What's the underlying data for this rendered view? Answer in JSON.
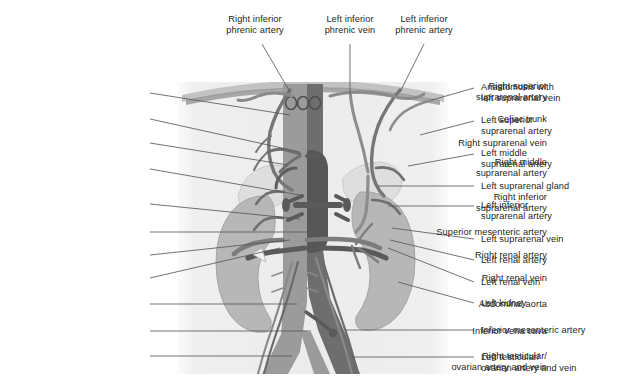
{
  "figure": {
    "panel": {
      "x": 178,
      "y": 82,
      "width": 270,
      "height": 292
    },
    "colors": {
      "background": "#ffffff",
      "panel_fill": "#f0f0f0",
      "panel_fill_inner": "#e9e9e9",
      "artery": "#9b9b9b",
      "vein": "#6e6e6e",
      "vein_dark": "#5a5a5a",
      "kidney": "#b4b4b4",
      "kidney_outline": "#9d9d9d",
      "suprarenal_gland": "#dcdcdc",
      "diaphragm": "#a8a8a8",
      "diaphragm_light": "#c9c9c9",
      "leader_line": "#5a5a5a",
      "text": "#231f20"
    }
  },
  "labels_top": [
    {
      "id": "right-inferior-phrenic-artery",
      "lines": [
        "Right inferior",
        "phrenic artery"
      ],
      "x": 200,
      "y": 14,
      "width": 110,
      "leader": [
        [
          262,
          44
        ],
        [
          290,
          92
        ]
      ]
    },
    {
      "id": "left-inferior-phrenic-vein",
      "lines": [
        "Left inferior",
        "phrenic vein"
      ],
      "x": 302,
      "y": 14,
      "width": 96,
      "leader": [
        [
          350,
          44
        ],
        [
          350,
          94
        ]
      ]
    },
    {
      "id": "left-inferior-phrenic-artery",
      "lines": [
        "Left inferior",
        "phrenic artery"
      ],
      "x": 372,
      "y": 14,
      "width": 104,
      "leader": [
        [
          424,
          44
        ],
        [
          400,
          92
        ]
      ]
    }
  ],
  "labels_left": [
    {
      "id": "right-superior-suprarenal-artery",
      "lines": [
        "Right superior",
        "suprarenal artery"
      ],
      "right": 547,
      "y": 81,
      "leader": [
        [
          150,
          93
        ],
        [
          290,
          115
        ]
      ]
    },
    {
      "id": "celiac-trunk",
      "lines": [
        "Celiac trunk"
      ],
      "right": 547,
      "y": 114,
      "leader": [
        [
          150,
          119
        ],
        [
          300,
          152
        ]
      ]
    },
    {
      "id": "right-suprarenal-vein",
      "lines": [
        "Right suprarenal vein"
      ],
      "right": 547,
      "y": 138,
      "leader": [
        [
          150,
          143
        ],
        [
          288,
          165
        ]
      ]
    },
    {
      "id": "right-middle-suprarenal-artery",
      "lines": [
        "Right middle",
        "suprarenal artery"
      ],
      "right": 547,
      "y": 157,
      "leader": [
        [
          150,
          169
        ],
        [
          300,
          195
        ]
      ]
    },
    {
      "id": "right-inferior-suprarenal-artery",
      "lines": [
        "Right inferior",
        "suprarenal artery"
      ],
      "right": 547,
      "y": 192,
      "leader": [
        [
          150,
          204
        ],
        [
          300,
          219
        ]
      ]
    },
    {
      "id": "superior-mesenteric-artery",
      "lines": [
        "Superior mesenteric artery"
      ],
      "right": 547,
      "y": 227,
      "leader": [
        [
          150,
          232
        ],
        [
          307,
          232
        ]
      ]
    },
    {
      "id": "right-renal-artery",
      "lines": [
        "Right renal artery"
      ],
      "right": 547,
      "y": 250,
      "leader": [
        [
          150,
          255
        ],
        [
          290,
          240
        ]
      ]
    },
    {
      "id": "right-renal-vein",
      "lines": [
        "Right renal vein"
      ],
      "right": 547,
      "y": 273,
      "leader": [
        [
          150,
          278
        ],
        [
          280,
          248
        ]
      ]
    },
    {
      "id": "abdominal-aorta",
      "lines": [
        "Abdominal aorta"
      ],
      "right": 547,
      "y": 299,
      "leader": [
        [
          150,
          304
        ],
        [
          297,
          304
        ]
      ]
    },
    {
      "id": "inferior-vena-cava",
      "lines": [
        "Inferior vena cava"
      ],
      "right": 547,
      "y": 326,
      "leader": [
        [
          150,
          331
        ],
        [
          311,
          331
        ]
      ]
    },
    {
      "id": "right-testicular-ovarian-artery-and-vein",
      "lines": [
        "Right testicular/",
        "ovarian artery and vein"
      ],
      "right": 547,
      "y": 351,
      "leader": [
        [
          150,
          356
        ],
        [
          292,
          356
        ]
      ]
    }
  ],
  "labels_right": [
    {
      "id": "anastomosis-with-left-suprarenal-vein",
      "lines": [
        "Anastomosis with",
        "left suprarenal vein"
      ],
      "left": 481,
      "y": 82,
      "leader": [
        [
          474,
          88
        ],
        [
          432,
          100
        ]
      ]
    },
    {
      "id": "left-superior-suprarenal-artery",
      "lines": [
        "Left superior",
        "suprarenal artery"
      ],
      "left": 481,
      "y": 115,
      "leader": [
        [
          474,
          121
        ],
        [
          420,
          135
        ]
      ]
    },
    {
      "id": "left-middle-suprarenal-artery",
      "lines": [
        "Left middle",
        "suprarenal artery"
      ],
      "left": 481,
      "y": 148,
      "leader": [
        [
          474,
          154
        ],
        [
          408,
          166
        ]
      ]
    },
    {
      "id": "left-suprarenal-gland",
      "lines": [
        "Left suprarenal gland"
      ],
      "left": 481,
      "y": 181,
      "leader": [
        [
          474,
          186
        ],
        [
          378,
          186
        ]
      ]
    },
    {
      "id": "left-inferior-suprarenal-artery",
      "lines": [
        "Left inferior",
        "suprarenal artery"
      ],
      "left": 481,
      "y": 200,
      "leader": [
        [
          474,
          206
        ],
        [
          388,
          206
        ]
      ]
    },
    {
      "id": "left-suprarenal-vein",
      "lines": [
        "Left suprarenal vein"
      ],
      "left": 481,
      "y": 234,
      "leader": [
        [
          474,
          239
        ],
        [
          392,
          228
        ]
      ]
    },
    {
      "id": "left-renal-artery",
      "lines": [
        "Left renal artery"
      ],
      "left": 481,
      "y": 255,
      "leader": [
        [
          474,
          260
        ],
        [
          390,
          240
        ]
      ]
    },
    {
      "id": "left-renal-vein",
      "lines": [
        "Left renal vein"
      ],
      "left": 481,
      "y": 277,
      "leader": [
        [
          474,
          282
        ],
        [
          388,
          248
        ]
      ]
    },
    {
      "id": "left-kidney",
      "lines": [
        "Left kidney"
      ],
      "left": 481,
      "y": 298,
      "leader": [
        [
          474,
          303
        ],
        [
          398,
          282
        ]
      ]
    },
    {
      "id": "inferior-mesenteric-artery",
      "lines": [
        "Inferior mesenteric artery"
      ],
      "left": 481,
      "y": 325,
      "leader": [
        [
          474,
          330
        ],
        [
          345,
          330
        ]
      ]
    },
    {
      "id": "left-testicular-ovarian-artery-and-vein",
      "lines": [
        "Left testicular/",
        "ovarian artery and vein"
      ],
      "left": 481,
      "y": 352,
      "leader": [
        [
          474,
          357
        ],
        [
          352,
          357
        ]
      ]
    }
  ]
}
